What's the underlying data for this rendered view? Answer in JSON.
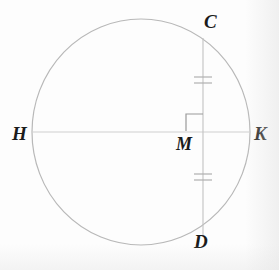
{
  "figure": {
    "kind": "geometry-diagram",
    "canvas": {
      "width": 279,
      "height": 270
    },
    "background_color": "#fdfdfd"
  },
  "colors": {
    "circle_stroke": "#b8b8b8",
    "chord_stroke": "#c2c2c2",
    "diameter_stroke": "#cfcfcf",
    "tick_stroke": "#b0b0b0",
    "right_angle_stroke": "#9a9a9a",
    "label_color": "#1b1b1b"
  },
  "circle": {
    "name": "circle-outline",
    "center_x": 141,
    "center_y": 132,
    "radius_x": 109,
    "radius_y": 113,
    "stroke_width": 1.2
  },
  "segments": [
    {
      "name": "diameter-HK",
      "from_label": "H",
      "to_label": "K",
      "x1": 32,
      "y1": 132,
      "x2": 250,
      "y2": 132,
      "stroke_width": 1.1,
      "orientation": "horizontal"
    },
    {
      "name": "chord-CD",
      "from_label": "C",
      "to_label": "D",
      "x1": 203,
      "y1": 38,
      "x2": 203,
      "y2": 236,
      "stroke_width": 1.1,
      "orientation": "vertical"
    }
  ],
  "intersection": {
    "name": "point-M",
    "label": "M",
    "x": 203,
    "y": 132
  },
  "right_angle": {
    "name": "right-angle-mark-at-M",
    "x": 186,
    "y": 114,
    "size": 17,
    "quadrant": "upper-left",
    "measure_degrees": 90
  },
  "tick_marks": {
    "name": "congruence-ticks",
    "count_per_segment": 2,
    "tick_half_width": 9,
    "tick_gap": 6,
    "upper": {
      "name": "ticks-CM",
      "center_y": 80,
      "marks_segment": "CM"
    },
    "lower": {
      "name": "ticks-MD",
      "center_y": 177,
      "marks_segment": "MD"
    }
  },
  "labels": [
    {
      "id": "C",
      "text": "C",
      "name": "vertex-label-c",
      "x": 204,
      "y": 12,
      "description": "top endpoint of chord on circle"
    },
    {
      "id": "H",
      "text": "H",
      "name": "vertex-label-h",
      "x": 12,
      "y": 124,
      "description": "left endpoint of diameter on circle"
    },
    {
      "id": "K",
      "text": "K",
      "name": "vertex-label-k",
      "x": 254,
      "y": 124,
      "description": "right endpoint of diameter on circle"
    },
    {
      "id": "M",
      "text": "M",
      "name": "vertex-label-m",
      "x": 176,
      "y": 135,
      "description": "intersection of chord and diameter"
    },
    {
      "id": "D",
      "text": "D",
      "name": "vertex-label-d",
      "x": 194,
      "y": 232,
      "description": "bottom endpoint of chord on circle"
    }
  ]
}
